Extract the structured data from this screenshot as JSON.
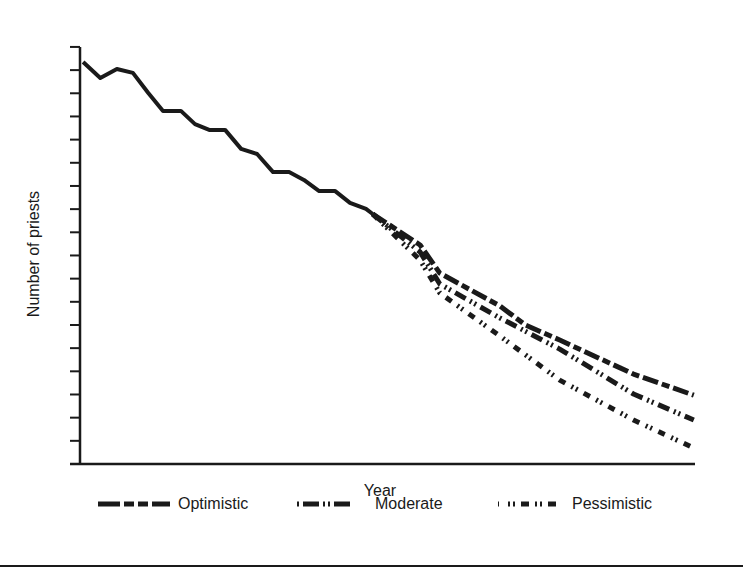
{
  "chart_data": {
    "type": "line",
    "title": "",
    "xlabel": "Year",
    "ylabel": "Number of priests",
    "y_tick_count": 18,
    "y_tick_labels": [],
    "x_tick_labels": [],
    "ylim": [
      0,
      18
    ],
    "grid": false,
    "legend_position": "bottom",
    "units_note": "y values are in axis tick units (no numeric labels shown); x values are relative positions 0-100 along the x-axis",
    "series": [
      {
        "name": "Historical",
        "style": "solid",
        "points": [
          [
            0.5,
            17.35
          ],
          [
            3.3,
            16.66
          ],
          [
            6.0,
            17.05
          ],
          [
            8.6,
            16.88
          ],
          [
            11.1,
            16.01
          ],
          [
            13.5,
            15.24
          ],
          [
            16.4,
            15.24
          ],
          [
            18.7,
            14.67
          ],
          [
            21.0,
            14.42
          ],
          [
            23.6,
            14.42
          ],
          [
            26.2,
            13.6
          ],
          [
            28.8,
            13.38
          ],
          [
            31.4,
            12.6
          ],
          [
            34.0,
            12.6
          ],
          [
            36.4,
            12.26
          ],
          [
            38.9,
            11.78
          ],
          [
            41.5,
            11.78
          ],
          [
            43.9,
            11.27
          ],
          [
            46.5,
            11.01
          ],
          [
            47.6,
            10.79
          ]
        ]
      },
      {
        "name": "Optimistic",
        "style": "long-dash",
        "points": [
          [
            47.6,
            10.79
          ],
          [
            55.3,
            9.45
          ],
          [
            58.5,
            8.24
          ],
          [
            68.3,
            6.82
          ],
          [
            72.4,
            6.0
          ],
          [
            78.0,
            5.35
          ],
          [
            90.0,
            3.88
          ],
          [
            99.8,
            2.97
          ]
        ]
      },
      {
        "name": "Moderate",
        "style": "dash-dot-dot",
        "points": [
          [
            47.6,
            10.79
          ],
          [
            55.3,
            9.15
          ],
          [
            58.5,
            7.77
          ],
          [
            68.3,
            6.3
          ],
          [
            78.0,
            4.96
          ],
          [
            90.0,
            3.02
          ],
          [
            99.8,
            1.9
          ]
        ]
      },
      {
        "name": "Pessimistic",
        "style": "dash-dot-dot-sparse",
        "points": [
          [
            47.6,
            10.79
          ],
          [
            55.3,
            8.8
          ],
          [
            58.5,
            7.38
          ],
          [
            68.3,
            5.52
          ],
          [
            78.0,
            3.62
          ],
          [
            90.0,
            1.9
          ],
          [
            99.8,
            0.69
          ]
        ]
      }
    ],
    "legend": [
      {
        "label": "Optimistic",
        "style": "long-dash"
      },
      {
        "label": "Moderate",
        "style": "dash-dot-dot"
      },
      {
        "label": "Pessimistic",
        "style": "dash-dot-dot-sparse"
      }
    ]
  },
  "axes": {
    "xlabel": "Year",
    "ylabel": "Number of priests"
  },
  "legend": {
    "items": [
      {
        "label": "Optimistic"
      },
      {
        "label": "Moderate"
      },
      {
        "label": "Pessimistic"
      }
    ]
  },
  "colors": {
    "ink": "#1a1a1a",
    "background": "#ffffff"
  }
}
